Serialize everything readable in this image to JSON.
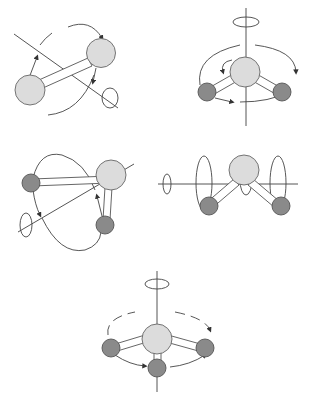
{
  "diagram": {
    "title": "",
    "panels": [
      {
        "id": "linear-rotation",
        "description": "Diatomic/linear molecule rotating about an axis perpendicular to the bond"
      },
      {
        "id": "bent-rotation-vertical",
        "description": "Bent triatomic molecule rotating about vertical C2 axis"
      },
      {
        "id": "bent-rotation-inplane",
        "description": "Bent triatomic molecule rotating about an in-plane axis"
      },
      {
        "id": "bent-rotation-horizontal",
        "description": "Bent triatomic molecule rotating about horizontal axis"
      },
      {
        "id": "pyramidal-rotation",
        "description": "Pyramidal molecule rotating about vertical C3 axis"
      }
    ],
    "colors": {
      "central_atom": "#dcdcdc",
      "outer_atom": "#8a8a8a",
      "line": "#555555",
      "background": "#ffffff"
    }
  }
}
